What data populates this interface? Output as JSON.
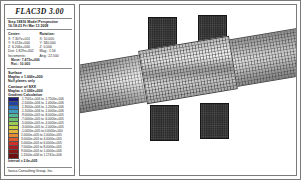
{
  "header": {
    "product_title": "FLAC3D 3.00",
    "step_line": "Step 18816 Model Perspective",
    "timestamp_line": "16:18:23 Fri Mar 13 2009"
  },
  "view": {
    "center_header": "Center:",
    "rotation_header": "Rotation:",
    "center": [
      "X: 7.307e+001",
      "Y: 9.413e+000",
      "Z: 6.206e+000"
    ],
    "rotation": [
      "X:  10.000",
      "Y: 340.000",
      "Z:   0.000"
    ],
    "dist_label": "Dist: 1.829e+002",
    "mag_label": "Mag.:     1.56",
    "increments_label": "Increments:",
    "ang_label": "Ang.:  22.500",
    "move_label": "Move: 7.473e+000",
    "rot_label": "Rot.:  10.000"
  },
  "surface": {
    "section_title": "Surface",
    "magfac": "Magfac = 1.000e+000",
    "note": "Null planes only"
  },
  "contour": {
    "section_title": "Contour of SXX",
    "magfac": "Magfac = 1.000e+000",
    "gradient_note": "Gradient Calculation",
    "interval_label": "Interval = 2.0e+005",
    "entries": [
      {
        "color": "#1b1b7a",
        "label": "-1.7561e+006 to -1.7500e+006"
      },
      {
        "color": "#2343a6",
        "label": "-1.5000e+006 to -1.4000e+006"
      },
      {
        "color": "#2f73c4",
        "label": "-1.3000e+006 to -1.2000e+006"
      },
      {
        "color": "#3f9fbe",
        "label": "-1.1000e+006 to -1.0000e+006"
      },
      {
        "color": "#52b59a",
        "label": "-9.0000e+005 to -8.0000e+005"
      },
      {
        "color": "#6fbf72",
        "label": "-7.0000e+005 to -6.0000e+005"
      },
      {
        "color": "#9ccb55",
        "label": "-5.0000e+005 to -4.0000e+005"
      },
      {
        "color": "#c7cf45",
        "label": "-3.0000e+005 to -2.0000e+005"
      },
      {
        "color": "#e2b63c",
        "label": "-1.0000e+005 to  0.0000e+000"
      },
      {
        "color": "#e58b33",
        "label": " 1.0000e+005 to  2.0000e+005"
      },
      {
        "color": "#dd5b2c",
        "label": " 3.0000e+005 to  4.0000e+005"
      },
      {
        "color": "#cc3326",
        "label": " 5.0000e+005 to  6.0000e+005"
      },
      {
        "color": "#a81f22",
        "label": " 7.0000e+005 to  8.0000e+005"
      },
      {
        "color": "#8b1717",
        "label": " 9.0000e+005 to  1.0000e+006"
      },
      {
        "color": "#6e1010",
        "label": " 1.1000e+006 to  1.1741e+006"
      }
    ]
  },
  "footer": {
    "company": "Itasca Consulting Group, Inc."
  },
  "chart_data": {
    "type": "heatmap",
    "xlabel": "",
    "ylabel": "",
    "grid": false,
    "legend_position": "left-panel",
    "colorbar_label": "SXX (Pa)",
    "colorbar_min": -1756100,
    "colorbar_max": 1174100,
    "colorbar_interval": 200000,
    "colorbar_ticks": [
      -1750000,
      -1500000,
      -1300000,
      -1100000,
      -900000,
      -700000,
      -500000,
      -300000,
      -100000,
      100000,
      300000,
      500000,
      700000,
      900000,
      1100000
    ],
    "annotations": [
      "Step 18816",
      "Magfac = 1.000e+000",
      "Null planes only",
      "Interval = 2.0e+005"
    ],
    "geometry": {
      "description": "Tilted meshed slab spanning view with two dark vertical pier blocks above and below",
      "slab_rotation_deg": -9.5,
      "blocks": 4
    }
  }
}
